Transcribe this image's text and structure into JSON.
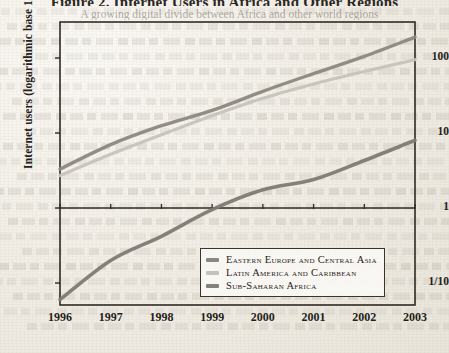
{
  "page": {
    "title": "Figure 2. Internet Users in Africa and Other Regions",
    "subtitle": "A growing digital divide between Africa and other world regions"
  },
  "chart_data": {
    "type": "line",
    "title": "Figure 2. Internet Users in Africa and Other Regions",
    "xlabel": "",
    "ylabel": "Internet users (logarithmic base 10 scale)",
    "scale": "log10",
    "grid": false,
    "legend_position": "bottom-right",
    "x": [
      1996,
      1997,
      1998,
      1999,
      2000,
      2001,
      2002,
      2003
    ],
    "xtick_labels": [
      "1996",
      "1997",
      "1998",
      "1999",
      "2000",
      "2001",
      "2002",
      "2003"
    ],
    "ytick_labels": [
      "100",
      "10",
      "1",
      "1/10"
    ],
    "ytick_values": [
      100,
      10,
      1,
      0.1
    ],
    "ylim": [
      0.045,
      320
    ],
    "series": [
      {
        "name": "Eastern Europe and Central Asia",
        "color": "#8c8880",
        "values": [
          3.3,
          7.0,
          12.5,
          20.0,
          36.0,
          62.0,
          105.0,
          190.0
        ]
      },
      {
        "name": "Latin America and Caribbean",
        "color": "#bdbab3",
        "values": [
          2.7,
          5.2,
          9.5,
          17.0,
          29.0,
          45.0,
          66.0,
          95.0
        ]
      },
      {
        "name": "Sub-Saharan Africa",
        "color": "#8a8views",
        "values": [
          0.06,
          0.2,
          0.42,
          0.95,
          1.75,
          2.4,
          4.3,
          8.0
        ]
      }
    ]
  },
  "legend": {
    "items": [
      {
        "label": "Eastern Europe and Central Asia",
        "color": "#8c8880"
      },
      {
        "label": "Latin America and Caribbean",
        "color": "#c4c1ba"
      },
      {
        "label": "Sub-Saharan Africa",
        "color": "#84807a"
      }
    ]
  },
  "axes": {
    "y_title": "Internet users (logarithmic base 10 scale)"
  }
}
